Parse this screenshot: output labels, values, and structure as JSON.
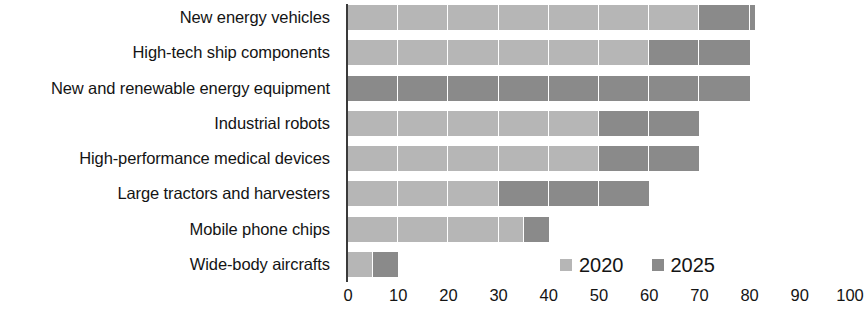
{
  "chart_data": {
    "type": "bar",
    "orientation": "horizontal",
    "stacked": true,
    "title": "",
    "subtitle": "",
    "xlabel": "",
    "ylabel": "",
    "xlim": [
      0,
      100
    ],
    "xticks": [
      0,
      10,
      20,
      30,
      40,
      50,
      60,
      70,
      80,
      90,
      100
    ],
    "xtick_labels": [
      "0",
      "10",
      "20",
      "30",
      "40",
      "50",
      "60",
      "70",
      "80",
      "90",
      "100"
    ],
    "grid": false,
    "legend_position": "inside-bottom-right",
    "categories": [
      "New energy vehicles",
      "High-tech ship components",
      "New and renewable energy equipment",
      "Industrial robots",
      "High-performance medical devices",
      "Large tractors and harvesters",
      "Mobile phone chips",
      "Wide-body aircrafts"
    ],
    "series": [
      {
        "name": "2020",
        "color": "#b6b6b6",
        "values": [
          70,
          60,
          0,
          50,
          50,
          30,
          35,
          5
        ]
      },
      {
        "name": "2025",
        "color": "#8a8a8a",
        "values": [
          11,
          20,
          80,
          20,
          20,
          30,
          5,
          5
        ]
      }
    ],
    "cumulative_totals": [
      81,
      80,
      80,
      70,
      70,
      60,
      40,
      10
    ],
    "legend": [
      {
        "label": "2020",
        "color": "#b6b6b6",
        "swatch": "legend-swatch-2020"
      },
      {
        "label": "2025",
        "color": "#8a8a8a",
        "swatch": "legend-swatch-2025"
      }
    ]
  },
  "colors": {
    "background": "#ffffff",
    "axis": "#3a3a3a",
    "text": "#141414",
    "series_2020": "#b6b6b6",
    "series_2025": "#8a8a8a"
  }
}
